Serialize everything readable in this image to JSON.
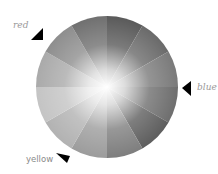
{
  "diagram": {
    "type": "color-wheel-grayscale",
    "center": [
      107,
      87
    ],
    "radius": 71,
    "segments": 12,
    "markers": [
      {
        "label": "red",
        "label_pos": [
          16,
          20
        ],
        "arrow": "up-right",
        "arrow_pos": [
          36,
          36
        ],
        "style": "italic"
      },
      {
        "label": "blue",
        "label_pos": [
          200,
          84
        ],
        "arrow": "left",
        "arrow_pos": [
          184,
          88
        ],
        "style": "italic"
      },
      {
        "label": "yellow",
        "label_pos": [
          26,
          151
        ],
        "arrow": "down-right",
        "arrow_pos": [
          62,
          158
        ],
        "style": "sans"
      }
    ],
    "segment_shades": [
      "#5a5a5a",
      "#6a6a6a",
      "#7a7a7a",
      "#6e6e6e",
      "#5e5e5e",
      "#7e7e7e",
      "#9c9c9c",
      "#b2b2b2",
      "#c4c4c4",
      "#aaaaaa",
      "#8e8e8e",
      "#707070"
    ],
    "center_color": "#ffffff"
  }
}
